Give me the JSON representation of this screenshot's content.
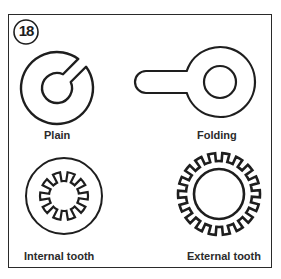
{
  "figure": {
    "badge_number": "18",
    "items": [
      {
        "label": "Plain",
        "shape": "plain-washer"
      },
      {
        "label": "Folding",
        "shape": "folding-washer"
      },
      {
        "label": "Internal tooth",
        "shape": "internal-tooth-washer"
      },
      {
        "label": "External tooth",
        "shape": "external-tooth-washer"
      }
    ]
  },
  "colors": {
    "stroke": "#1e1e1e",
    "background": "#ffffff"
  }
}
